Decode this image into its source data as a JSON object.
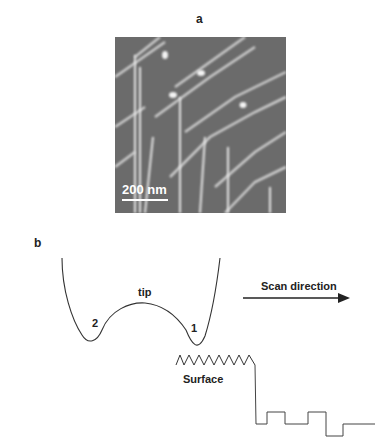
{
  "panel_a": {
    "label": "a",
    "image_description": "AFM grayscale image with bright diagonal and vertical line features",
    "scale_bar": "200 nm"
  },
  "panel_b": {
    "label": "b",
    "tip_label": "tip",
    "point_1": "1",
    "point_2": "2",
    "surface_label": "Surface",
    "arrow_label": "Scan direction"
  }
}
